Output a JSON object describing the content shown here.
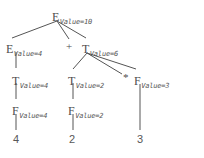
{
  "diagram": {
    "attribute_label": "Value",
    "stroke_color": "#555555",
    "text_color": "#4d4d4d",
    "background_color": "#ffffff",
    "nodes": [
      {
        "id": "e0",
        "symbol": "E",
        "attr": "Value=10",
        "x": 52,
        "y": 8
      },
      {
        "id": "e1",
        "symbol": "E",
        "attr": "Value=4",
        "x": 6,
        "y": 40
      },
      {
        "id": "t1",
        "symbol": "T",
        "attr": "Value=6",
        "x": 82,
        "y": 40
      },
      {
        "id": "t2",
        "symbol": "T",
        "attr": "Value=4",
        "x": 12,
        "y": 72
      },
      {
        "id": "t3",
        "symbol": "T",
        "attr": "Value=2",
        "x": 68,
        "y": 72
      },
      {
        "id": "f3",
        "symbol": "F",
        "attr": "Value=3",
        "x": 134,
        "y": 72
      },
      {
        "id": "f1",
        "symbol": "F",
        "attr": "Value=4",
        "x": 12,
        "y": 102
      },
      {
        "id": "f2",
        "symbol": "F",
        "attr": "Value=2",
        "x": 68,
        "y": 102
      }
    ],
    "operators": [
      {
        "id": "plus",
        "text": "+",
        "x": 66,
        "y": 41
      },
      {
        "id": "times",
        "text": "*",
        "x": 123,
        "y": 72
      }
    ],
    "leaves": [
      {
        "id": "leaf4",
        "text": "4",
        "x": 13,
        "y": 134
      },
      {
        "id": "leaf2",
        "text": "2",
        "x": 69,
        "y": 134
      },
      {
        "id": "leaf3",
        "text": "3",
        "x": 137,
        "y": 134
      }
    ],
    "edges": [
      {
        "from": "e0",
        "to": "e1",
        "x1": 57,
        "y1": 21,
        "x2": 12,
        "y2": 38
      },
      {
        "from": "e0",
        "to": "plus",
        "x1": 57,
        "y1": 21,
        "x2": 69,
        "y2": 39
      },
      {
        "from": "e0",
        "to": "t1",
        "x1": 57,
        "y1": 21,
        "x2": 86,
        "y2": 38
      },
      {
        "from": "e1",
        "to": "t2",
        "x1": 16,
        "y1": 52,
        "x2": 16,
        "y2": 68
      },
      {
        "from": "t2",
        "to": "f1",
        "x1": 16,
        "y1": 83,
        "x2": 16,
        "y2": 99
      },
      {
        "from": "f1",
        "to": "leaf4",
        "x1": 16,
        "y1": 114,
        "x2": 16,
        "y2": 130
      },
      {
        "from": "t1",
        "to": "t3",
        "x1": 87,
        "y1": 53,
        "x2": 73,
        "y2": 69
      },
      {
        "from": "t1",
        "to": "times",
        "x1": 87,
        "y1": 53,
        "x2": 122,
        "y2": 74
      },
      {
        "from": "t1",
        "to": "f3",
        "x1": 87,
        "y1": 53,
        "x2": 136,
        "y2": 69
      },
      {
        "from": "t3",
        "to": "f2",
        "x1": 73,
        "y1": 83,
        "x2": 73,
        "y2": 99
      },
      {
        "from": "f2",
        "to": "leaf2",
        "x1": 73,
        "y1": 114,
        "x2": 73,
        "y2": 130
      },
      {
        "from": "f3",
        "to": "leaf3",
        "x1": 140,
        "y1": 84,
        "x2": 140,
        "y2": 130
      }
    ]
  }
}
